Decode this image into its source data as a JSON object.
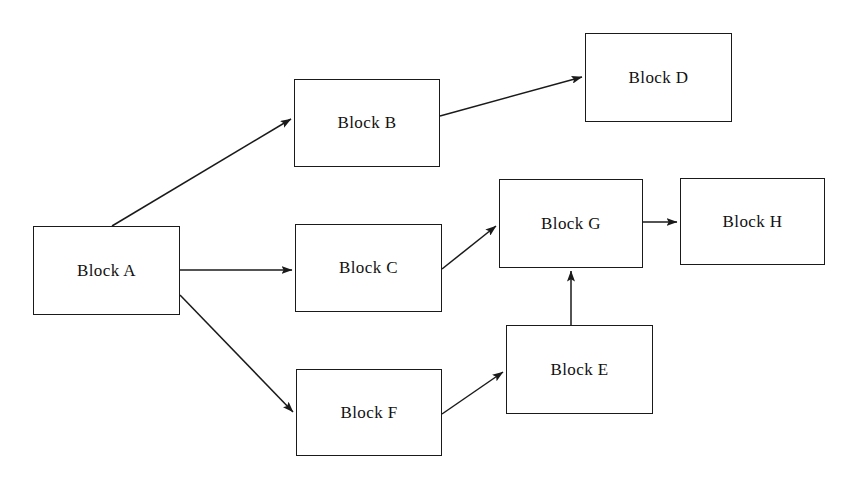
{
  "diagram": {
    "canvas": {
      "width": 850,
      "height": 488,
      "background": "#ffffff"
    },
    "style": {
      "node_border_color": "#1a1a1a",
      "node_fill_color": "#ffffff",
      "edge_color": "#1a1a1a",
      "label_color": "#111111"
    },
    "nodes": [
      {
        "id": "A",
        "label": "Block A",
        "x": 33,
        "y": 226,
        "width": 147,
        "height": 89
      },
      {
        "id": "B",
        "label": "Block B",
        "x": 294,
        "y": 79,
        "width": 146,
        "height": 88
      },
      {
        "id": "C",
        "label": "Block C",
        "x": 295,
        "y": 224,
        "width": 147,
        "height": 88
      },
      {
        "id": "D",
        "label": "Block D",
        "x": 585,
        "y": 33,
        "width": 147,
        "height": 89
      },
      {
        "id": "E",
        "label": "Block E",
        "x": 506,
        "y": 325,
        "width": 147,
        "height": 89
      },
      {
        "id": "F",
        "label": "Block F",
        "x": 296,
        "y": 369,
        "width": 146,
        "height": 87
      },
      {
        "id": "G",
        "label": "Block G",
        "x": 499,
        "y": 179,
        "width": 144,
        "height": 89
      },
      {
        "id": "H",
        "label": "Block H",
        "x": 680,
        "y": 178,
        "width": 145,
        "height": 87
      }
    ],
    "edges": [
      {
        "id": "a-to-b",
        "from": "A",
        "to": "B",
        "x1": 112,
        "y1": 226,
        "x2": 291,
        "y2": 119
      },
      {
        "id": "a-to-c",
        "from": "A",
        "to": "C",
        "x1": 180,
        "y1": 270,
        "x2": 292,
        "y2": 270
      },
      {
        "id": "a-to-f",
        "from": "A",
        "to": "F",
        "x1": 180,
        "y1": 295,
        "x2": 293,
        "y2": 412
      },
      {
        "id": "b-to-d",
        "from": "B",
        "to": "D",
        "x1": 440,
        "y1": 116,
        "x2": 582,
        "y2": 77
      },
      {
        "id": "c-to-g",
        "from": "C",
        "to": "G",
        "x1": 442,
        "y1": 269,
        "x2": 496,
        "y2": 226
      },
      {
        "id": "f-to-e",
        "from": "F",
        "to": "E",
        "x1": 442,
        "y1": 414,
        "x2": 503,
        "y2": 372
      },
      {
        "id": "e-to-g",
        "from": "E",
        "to": "G",
        "x1": 571,
        "y1": 325,
        "x2": 571,
        "y2": 271
      },
      {
        "id": "g-to-h",
        "from": "G",
        "to": "H",
        "x1": 643,
        "y1": 222,
        "x2": 677,
        "y2": 222
      }
    ]
  }
}
